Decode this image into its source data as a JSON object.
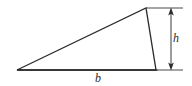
{
  "figure": {
    "kind": "geometry-diagram",
    "background_color": "#ffffff",
    "stroke_color": "#2b2b2b",
    "dimension_color": "#3a3a3a",
    "labels": {
      "height": "h",
      "base": "b"
    },
    "geometry": {
      "left_vertex": [
        17,
        70
      ],
      "apex_vertex": [
        146,
        8
      ],
      "right_vertex": [
        156,
        70
      ],
      "base_line": [
        [
          17,
          70
        ],
        [
          157,
          70
        ]
      ],
      "top_extension_line": [
        [
          146,
          8
        ],
        [
          183,
          8
        ]
      ],
      "bottom_extension_line": [
        [
          156,
          70
        ],
        [
          183,
          70
        ]
      ],
      "height_dimension_line": [
        [
          171,
          8
        ],
        [
          171,
          70
        ]
      ]
    }
  }
}
